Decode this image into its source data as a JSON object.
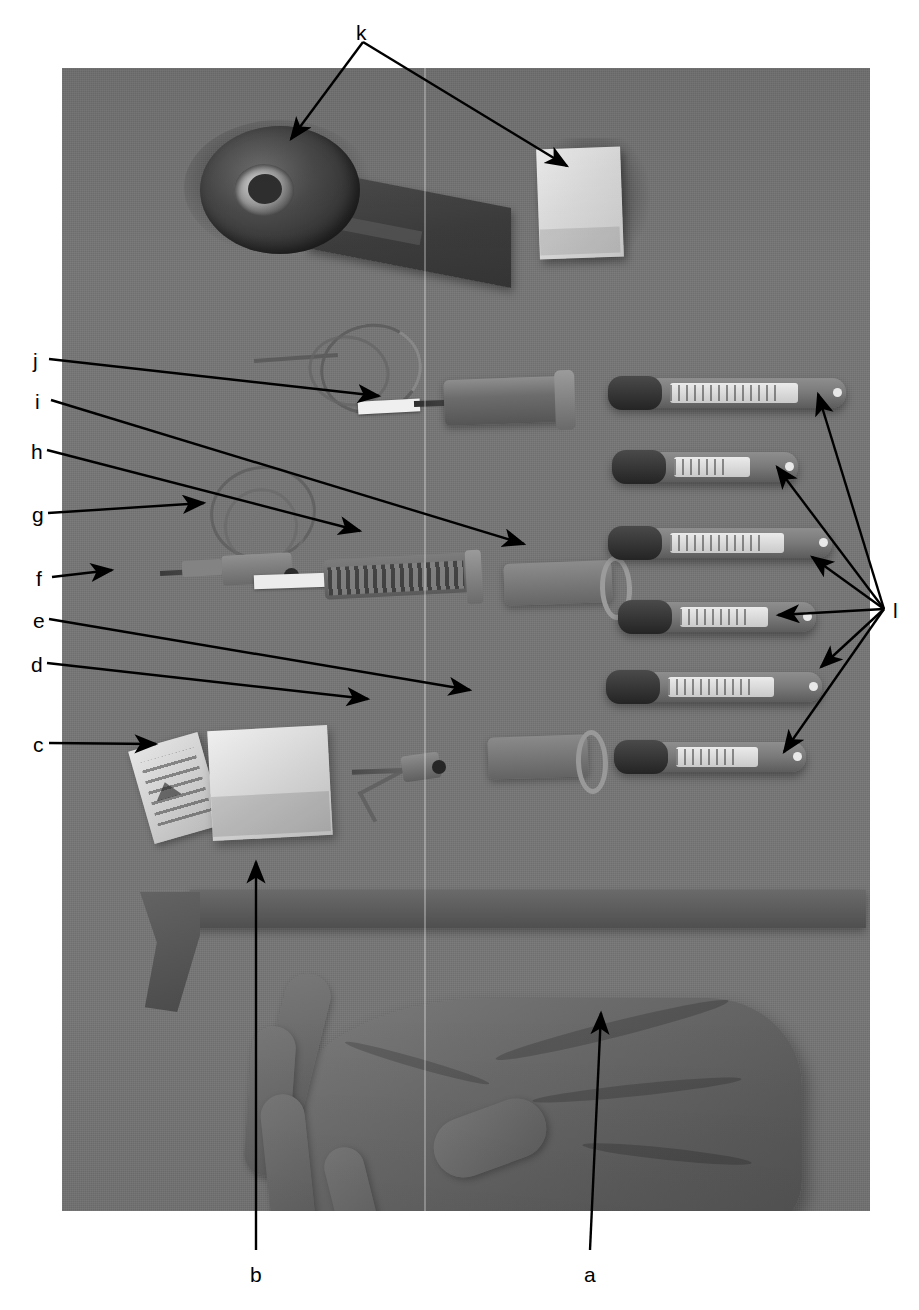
{
  "figure": {
    "type": "labeled-photograph",
    "caption_labels": [
      "a",
      "b",
      "c",
      "d",
      "e",
      "f",
      "g",
      "h",
      "i",
      "j",
      "k",
      "l"
    ],
    "background_color": "#ffffff",
    "photo_background_color": "#767676",
    "line_color": "#000000"
  },
  "labels": {
    "a": "a",
    "b": "b",
    "c": "c",
    "d": "d",
    "e": "e",
    "f": "f",
    "g": "g",
    "h": "h",
    "i": "i",
    "j": "j",
    "k": "k",
    "l": "l"
  },
  "annotations": [
    {
      "id": "k",
      "label": "k",
      "label_x": 356,
      "label_y": 22,
      "arrow_count": 2,
      "targets": [
        [
          291,
          139
        ],
        [
          567,
          166
        ]
      ]
    },
    {
      "id": "j",
      "label": "j",
      "label_x": 33,
      "label_y": 350,
      "arrow_count": 1,
      "targets": [
        [
          379,
          396
        ]
      ]
    },
    {
      "id": "i",
      "label": "i",
      "label_x": 35,
      "label_y": 391,
      "arrow_count": 1,
      "targets": [
        [
          524,
          544
        ]
      ]
    },
    {
      "id": "h",
      "label": "h",
      "label_x": 31,
      "label_y": 441,
      "arrow_count": 1,
      "targets": [
        [
          360,
          531
        ]
      ]
    },
    {
      "id": "g",
      "label": "g",
      "label_x": 32,
      "label_y": 504,
      "arrow_count": 1,
      "targets": [
        [
          204,
          503
        ]
      ]
    },
    {
      "id": "f",
      "label": "f",
      "label_x": 36,
      "label_y": 568,
      "arrow_count": 1,
      "targets": [
        [
          112,
          570
        ]
      ]
    },
    {
      "id": "e",
      "label": "e",
      "label_x": 33,
      "label_y": 610,
      "arrow_count": 1,
      "targets": [
        [
          470,
          690
        ]
      ]
    },
    {
      "id": "d",
      "label": "d",
      "label_x": 31,
      "label_y": 654,
      "arrow_count": 1,
      "targets": [
        [
          368,
          699
        ]
      ]
    },
    {
      "id": "c",
      "label": "c",
      "label_x": 33,
      "label_y": 734,
      "arrow_count": 1,
      "targets": [
        [
          156,
          744
        ]
      ]
    },
    {
      "id": "l",
      "label": "l",
      "label_x": 893,
      "label_y": 600,
      "arrow_count": 6,
      "vertex": [
        884,
        609
      ],
      "targets": [
        [
          818,
          394
        ],
        [
          777,
          467
        ],
        [
          812,
          557
        ],
        [
          778,
          615
        ],
        [
          821,
          667
        ],
        [
          784,
          752
        ]
      ]
    },
    {
      "id": "b",
      "label": "b",
      "label_x": 250,
      "label_y": 1264,
      "arrow_count": 1,
      "targets": [
        [
          256,
          862
        ]
      ]
    },
    {
      "id": "a",
      "label": "a",
      "label_x": 584,
      "label_y": 1264,
      "arrow_count": 1,
      "targets": [
        [
          601,
          1013
        ]
      ]
    }
  ],
  "photo": {
    "x": 62,
    "y": 68,
    "width": 808,
    "height": 1143,
    "items": [
      {
        "name": "adhesive-tape-roll",
        "label": "k",
        "row": 1
      },
      {
        "name": "gauze-pad",
        "label": "k",
        "row": 1
      },
      {
        "name": "iv-tubing-loop",
        "label": "j",
        "row": 2
      },
      {
        "name": "tube-holder-upper",
        "label": "i",
        "row": 2
      },
      {
        "name": "syringe-with-plunger",
        "label": "h",
        "row": 3
      },
      {
        "name": "iv-loop-small",
        "label": "g",
        "row": 3
      },
      {
        "name": "needle-adapter",
        "label": "f",
        "row": 3
      },
      {
        "name": "tube-holder-lower",
        "label": "e",
        "row": 4
      },
      {
        "name": "butterfly-needle",
        "label": "d",
        "row": 4
      },
      {
        "name": "alcohol-prep-packet",
        "label": "c",
        "row": 4
      },
      {
        "name": "blood-collection-tube",
        "label": "l",
        "count": 6
      },
      {
        "name": "tourniquet-band",
        "label": "b",
        "row": 5
      },
      {
        "name": "examination-glove",
        "label": "a",
        "row": 6
      }
    ],
    "vacutainer_tubes": [
      {
        "index": 1,
        "x": 608,
        "y": 378,
        "width": 238
      },
      {
        "index": 2,
        "x": 612,
        "y": 452,
        "width": 186
      },
      {
        "index": 3,
        "x": 608,
        "y": 528,
        "width": 224
      },
      {
        "index": 4,
        "x": 618,
        "y": 602,
        "width": 198
      },
      {
        "index": 5,
        "x": 606,
        "y": 672,
        "width": 216
      },
      {
        "index": 6,
        "x": 614,
        "y": 742,
        "width": 192
      }
    ]
  }
}
